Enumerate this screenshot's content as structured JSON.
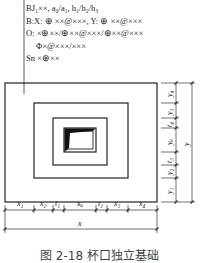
{
  "annotation": {
    "lines": [
      "BJ₁××, a₀/a₁, h₁/h₂/h₃",
      "B:X: ⊕ ××@×××, Y: ⊕ ××@×××",
      "O: ×⊕××/⊕××@×××/⊕××@×××",
      "Φ×@×××/×××",
      "Sn  ×⊕××"
    ]
  },
  "dimensions": {
    "horizontal": [
      "x1",
      "x2",
      "t1",
      "xu",
      "t2",
      "x3",
      "x4"
    ],
    "horizontal_labels": [
      "x₁",
      "x₂",
      "t₁",
      "xᵤ",
      "t₂",
      "x₃",
      "x₄"
    ],
    "horizontal_total": "x",
    "vertical_labels": [
      "y₁",
      "y₂",
      "t₃",
      "yᵤ",
      "t₄",
      "y₃",
      "y₄"
    ],
    "vertical_total": "y"
  },
  "caption": "图 2-18  杯口独立基础"
}
